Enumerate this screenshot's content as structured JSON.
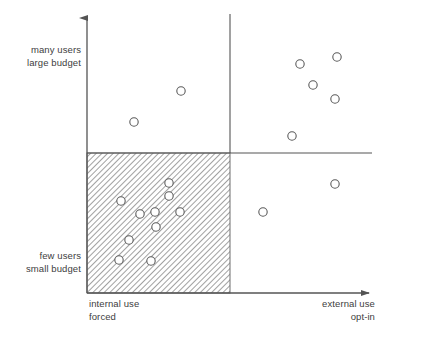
{
  "figure": {
    "background_color": "#ffffff",
    "line_color": "#545454",
    "marker_stroke_color": "#5a5a5a",
    "marker_fill_color": "#ffffff",
    "hatch_color": "#6e6e6e",
    "footer_caption": ""
  },
  "labels": {
    "y_top_line1": "many users",
    "y_top_line2": "large budget",
    "y_bottom_line1": "few users",
    "y_bottom_line2": "small budget",
    "x_left_line1": "internal use",
    "x_left_line2": "forced",
    "x_right_line1": "external use",
    "x_right_line2": "opt-in"
  },
  "chart_data": {
    "type": "scatter",
    "title": "",
    "xlabel": "use context (internal use / forced  →  external use / opt-in)",
    "ylabel": "users and budget (few users / small budget  →  many users / large budget)",
    "xlim": [
      0,
      1
    ],
    "ylim": [
      0,
      1
    ],
    "grid": false,
    "legend": "none",
    "axes": {
      "y_axis_x_px": 87,
      "y_axis_top_px": 14,
      "y_axis_bottom_px": 293,
      "x_axis_y_px": 293,
      "x_axis_left_px": 87,
      "x_axis_right_px": 375,
      "y_axis_arrow": "up",
      "x_axis_arrow": "right"
    },
    "dividers": {
      "vertical_line_x_px": 230,
      "vertical_line_top_px": 14,
      "vertical_line_bottom_px": 153,
      "horizontal_line_y_px": 153,
      "horizontal_line_left_px": 87,
      "horizontal_line_right_px": 372
    },
    "highlight_region": {
      "name": "hatched-quadrant",
      "quadrant": "lower-left",
      "fill": "diagonal-hatch",
      "hatch_angle_deg": 45,
      "x_px": 87,
      "y_px": 153,
      "width_px": 143,
      "height_px": 140
    },
    "marker": {
      "shape": "circle-open",
      "radius_px": 4.2,
      "stroke_width_px": 1.1
    },
    "series": [
      {
        "name": "upper-left quadrant",
        "quadrant": "upper-left",
        "count": 2,
        "points_px": [
          [
            181,
            91
          ],
          [
            134,
            122
          ]
        ]
      },
      {
        "name": "upper-right quadrant",
        "quadrant": "upper-right",
        "count": 5,
        "points_px": [
          [
            300,
            64
          ],
          [
            337,
            57
          ],
          [
            313,
            85
          ],
          [
            335,
            99
          ],
          [
            292,
            136
          ]
        ]
      },
      {
        "name": "lower-left quadrant (hatched)",
        "quadrant": "lower-left",
        "count": 10,
        "points_px": [
          [
            169,
            183
          ],
          [
            169,
            196
          ],
          [
            121,
            201
          ],
          [
            155,
            212
          ],
          [
            180,
            212
          ],
          [
            156,
            227
          ],
          [
            129,
            240
          ],
          [
            119,
            260
          ],
          [
            151,
            261
          ],
          [
            140,
            214
          ]
        ]
      },
      {
        "name": "lower-right quadrant",
        "quadrant": "lower-right",
        "count": 2,
        "points_px": [
          [
            335,
            184
          ],
          [
            263,
            212
          ]
        ]
      }
    ]
  }
}
